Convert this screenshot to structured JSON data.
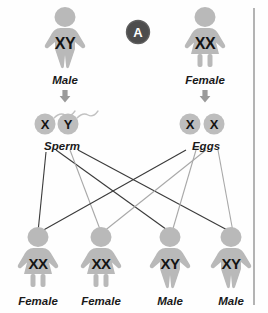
{
  "panel": {
    "letter": "A",
    "badge_color": "#4d4d4d"
  },
  "parents": [
    {
      "id": "father",
      "genotype": "XY",
      "label": "Male",
      "sex": "male",
      "x": 65
    },
    {
      "id": "mother",
      "genotype": "XX",
      "label": "Female",
      "sex": "female",
      "x": 205
    }
  ],
  "gametes": {
    "sperm": {
      "label": "Sperm",
      "label_x": 62,
      "cells": [
        {
          "letter": "X",
          "x": 45,
          "y": 124
        },
        {
          "letter": "Y",
          "x": 68,
          "y": 124
        }
      ]
    },
    "eggs": {
      "label": "Eggs",
      "label_x": 206,
      "cells": [
        {
          "letter": "X",
          "x": 190,
          "y": 124
        },
        {
          "letter": "X",
          "x": 214,
          "y": 124
        }
      ]
    }
  },
  "offspring": [
    {
      "genotype": "XX",
      "label": "Female",
      "sex": "female",
      "x": 38
    },
    {
      "genotype": "XX",
      "label": "Female",
      "sex": "female",
      "x": 101
    },
    {
      "genotype": "XY",
      "label": "Male",
      "sex": "male",
      "x": 170
    },
    {
      "genotype": "XY",
      "label": "Male",
      "sex": "male",
      "x": 231
    }
  ],
  "crosses": [
    {
      "from": "sperm-x",
      "to": "child-1",
      "x1": 46,
      "y1": 152,
      "x2": 38,
      "y2": 232,
      "tone": "dark"
    },
    {
      "from": "sperm-x",
      "to": "child-3",
      "x1": 56,
      "y1": 150,
      "x2": 170,
      "y2": 232,
      "tone": "dark"
    },
    {
      "from": "sperm-y",
      "to": "child-2",
      "x1": 70,
      "y1": 150,
      "x2": 101,
      "y2": 232,
      "tone": "light"
    },
    {
      "from": "sperm-y",
      "to": "child-4",
      "x1": 78,
      "y1": 150,
      "x2": 231,
      "y2": 232,
      "tone": "dark"
    },
    {
      "from": "egg-x1",
      "to": "child-1",
      "x1": 186,
      "y1": 150,
      "x2": 40,
      "y2": 232,
      "tone": "dark"
    },
    {
      "from": "egg-x1",
      "to": "child-3",
      "x1": 196,
      "y1": 150,
      "x2": 172,
      "y2": 232,
      "tone": "light"
    },
    {
      "from": "egg-x2",
      "to": "child-2",
      "x1": 206,
      "y1": 150,
      "x2": 103,
      "y2": 232,
      "tone": "light"
    },
    {
      "from": "egg-x2",
      "to": "child-4",
      "x1": 218,
      "y1": 150,
      "x2": 233,
      "y2": 232,
      "tone": "light"
    }
  ],
  "divider": {
    "x": 254
  },
  "colors": {
    "figure_gray": "#b9b9b9",
    "gamete_gray": "#bdbdbd",
    "text_dark": "#141414",
    "line_dark": "#3a3a3a",
    "line_light": "#a8a8a8",
    "background": "#fefefe"
  }
}
